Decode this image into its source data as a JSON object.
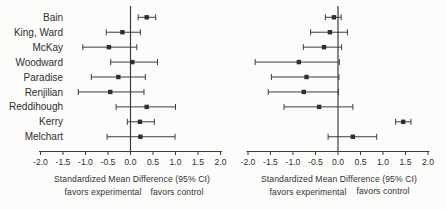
{
  "captions": {
    "axis_title": "Standardized Mean Difference (95% CI)",
    "favors_left": "favors experimental",
    "favors_right": "favors control"
  },
  "colors": {
    "line": "#3d3d3d",
    "marker": "#2f2f2f",
    "text": "#2e2e2e",
    "background": "#fcfcfb"
  },
  "chart_data": [
    {
      "type": "scatter",
      "subtype": "forest",
      "title": "",
      "xlabel": "Standardized Mean Difference (95% CI)",
      "annotations": [
        "favors experimental",
        "favors control"
      ],
      "xlim": [
        -2.0,
        2.0
      ],
      "xticks": [
        "-2.0",
        "-1.5",
        "-1.0",
        "-0.5",
        "0.0",
        "0.5",
        "1.0",
        "1.5",
        "2.0"
      ],
      "grid": false,
      "zero_reference_line": 0.0,
      "points": [
        {
          "study": "Bain",
          "mean": 0.36,
          "ci_low": 0.17,
          "ci_high": 0.56
        },
        {
          "study": "King, Ward",
          "mean": -0.18,
          "ci_low": -0.54,
          "ci_high": 0.22
        },
        {
          "study": "McKay",
          "mean": -0.48,
          "ci_low": -1.06,
          "ci_high": 0.14
        },
        {
          "study": "Woodward",
          "mean": 0.04,
          "ci_low": -0.44,
          "ci_high": 0.6
        },
        {
          "study": "Paradise",
          "mean": -0.27,
          "ci_low": -0.87,
          "ci_high": 0.33
        },
        {
          "study": "Renjilian",
          "mean": -0.45,
          "ci_low": -1.16,
          "ci_high": 0.3
        },
        {
          "study": "Reddihough",
          "mean": 0.36,
          "ci_low": -0.32,
          "ci_high": 1.0
        },
        {
          "study": "Kerry",
          "mean": 0.21,
          "ci_low": -0.07,
          "ci_high": 0.53
        },
        {
          "study": "Melchart",
          "mean": 0.22,
          "ci_low": -0.52,
          "ci_high": 0.99
        }
      ]
    },
    {
      "type": "scatter",
      "subtype": "forest",
      "title": "",
      "xlabel": "Standardized Mean Difference (95% CI)",
      "annotations": [
        "favors experimental",
        "favors control"
      ],
      "xlim": [
        -2.0,
        2.0
      ],
      "xticks": [
        "-2.0",
        "-1.5",
        "-1.0",
        "-0.5",
        "0.0",
        "0.5",
        "1.0",
        "1.5",
        "2.0"
      ],
      "grid": false,
      "zero_reference_line": 0.0,
      "points": [
        {
          "study": "Bain",
          "mean": -0.09,
          "ci_low": -0.28,
          "ci_high": 0.07
        },
        {
          "study": "King, Ward",
          "mean": -0.18,
          "ci_low": -0.61,
          "ci_high": 0.21
        },
        {
          "study": "McKay",
          "mean": -0.31,
          "ci_low": -0.77,
          "ci_high": 0.08
        },
        {
          "study": "Woodward",
          "mean": -0.87,
          "ci_low": -1.84,
          "ci_high": 0.03
        },
        {
          "study": "Paradise",
          "mean": -0.7,
          "ci_low": -1.48,
          "ci_high": 0.02
        },
        {
          "study": "Renjilian",
          "mean": -0.76,
          "ci_low": -1.55,
          "ci_high": 0.01
        },
        {
          "study": "Reddihough",
          "mean": -0.42,
          "ci_low": -1.2,
          "ci_high": 0.33
        },
        {
          "study": "Kerry",
          "mean": 1.45,
          "ci_low": 1.28,
          "ci_high": 1.62
        },
        {
          "study": "Melchart",
          "mean": 0.33,
          "ci_low": -0.22,
          "ci_high": 0.86
        }
      ]
    }
  ]
}
